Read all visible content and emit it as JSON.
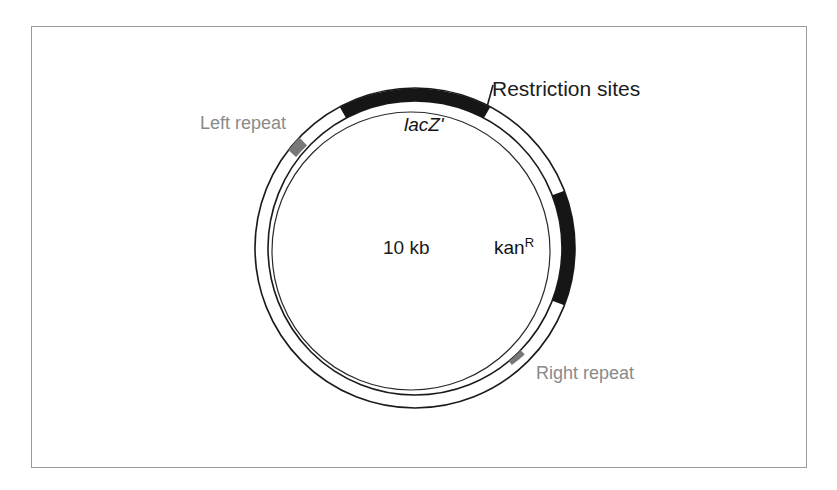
{
  "figure": {
    "type": "plasmid-map",
    "frame": {
      "border_color": "#9a9a9a"
    },
    "background": "#ffffff"
  },
  "plasmid": {
    "size_label": "10 kb",
    "center": {
      "x": 415,
      "y": 248
    },
    "outer_radius": 160,
    "inner_radius": 147,
    "ring_stroke": "#1a1a1a",
    "ring_fill": "#ffffff",
    "inner_guide_radius": 139
  },
  "segments": [
    {
      "id": "lacz-restriction-arc",
      "name": "lacZ-black-arc",
      "color": "#161616",
      "start_angle_deg": -118,
      "end_angle_deg": -62,
      "label": "lacZ'"
    },
    {
      "id": "kan-arc",
      "name": "kanamycin-resistance-arc",
      "color": "#161616",
      "start_angle_deg": -21,
      "end_angle_deg": 21,
      "label": "kan"
    }
  ],
  "markers": [
    {
      "id": "left-repeat-marker",
      "color": "#787878",
      "angle_deg": -145,
      "label": "Left repeat"
    },
    {
      "id": "right-repeat-marker",
      "color": "#787878",
      "angle_deg": 44,
      "label": "Right repeat"
    }
  ],
  "labels": {
    "restriction_sites": "Restriction sites",
    "left_repeat": "Left repeat",
    "right_repeat": "Right repeat",
    "lacz": "lacZ'",
    "kan": "kan",
    "kan_superscript": "R",
    "size": "10 kb"
  },
  "leader_line": {
    "id": "restriction-sites-leader",
    "from": {
      "x": 487,
      "y": 107
    },
    "to": {
      "x": 492,
      "y": 86
    },
    "color": "#1a1a1a"
  }
}
